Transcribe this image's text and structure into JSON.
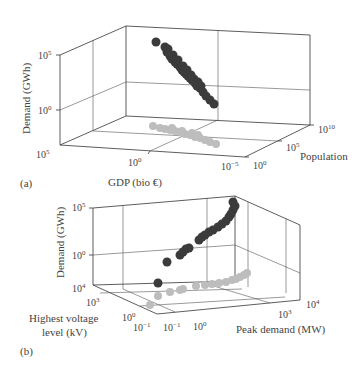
{
  "figure": {
    "panels": [
      {
        "id": "a",
        "label": "(a)",
        "zlabel": "Demand (GWh)",
        "xlabel": "GDP (bio €)",
        "ylabel": "Population",
        "z_ticks": [
          {
            "base": "10",
            "exp": "5"
          },
          {
            "base": "10",
            "exp": "0"
          }
        ],
        "x_ticks": [
          {
            "base": "10",
            "exp": "5"
          },
          {
            "base": "10",
            "exp": "0"
          },
          {
            "base": "10",
            "exp": "−5"
          }
        ],
        "y_ticks": [
          {
            "base": "10",
            "exp": "0"
          },
          {
            "base": "10",
            "exp": "5"
          },
          {
            "base": "10",
            "exp": "10"
          }
        ]
      },
      {
        "id": "b",
        "label": "(b)",
        "zlabel": "Demand (GWh)",
        "xlabel": "Peak demand (MW)",
        "ylabel_line1": "Highest voltage",
        "ylabel_line2": "level (kV)",
        "z_ticks": [
          {
            "base": "10",
            "exp": "5"
          },
          {
            "base": "10",
            "exp": "0"
          }
        ],
        "y_ticks": [
          {
            "base": "10",
            "exp": "4"
          },
          {
            "base": "10",
            "exp": "3"
          },
          {
            "base": "10",
            "exp": "0"
          },
          {
            "base": "10",
            "exp": "−1"
          }
        ],
        "x_ticks": [
          {
            "base": "10",
            "exp": "−1"
          },
          {
            "base": "10",
            "exp": "0"
          },
          {
            "base": "10",
            "exp": "3"
          },
          {
            "base": "10",
            "exp": "4"
          }
        ]
      }
    ]
  },
  "colors": {
    "points": "#3b3b3b",
    "projections": "#bdbdbd",
    "axes": "#333333"
  },
  "chart_data": [
    {
      "type": "scatter",
      "title": "",
      "panel": "(a)",
      "xlabel": "GDP (bio €)",
      "ylabel": "Population",
      "zlabel": "Demand (GWh)",
      "x_range_log10": [
        -5,
        5
      ],
      "y_range_log10": [
        0,
        10
      ],
      "z_range_log10": [
        -5,
        5
      ],
      "grid": true,
      "series": [
        {
          "name": "data (3D points)",
          "color": "#3b3b3b",
          "screen_points": [
            [
              156,
              42
            ],
            [
              165,
              47
            ],
            [
              167,
              52
            ],
            [
              170,
              56
            ],
            [
              172,
              59
            ],
            [
              175,
              62
            ],
            [
              177,
              64
            ],
            [
              180,
              67
            ],
            [
              182,
              70
            ],
            [
              184,
              72
            ],
            [
              186,
              74
            ],
            [
              188,
              76
            ],
            [
              190,
              78
            ],
            [
              192,
              80
            ],
            [
              195,
              83
            ],
            [
              197,
              86
            ],
            [
              200,
              88
            ],
            [
              203,
              92
            ],
            [
              206,
              96
            ],
            [
              210,
              100
            ],
            [
              214,
              104
            ],
            [
              168,
              49
            ],
            [
              173,
              55
            ],
            [
              178,
              60
            ],
            [
              183,
              66
            ],
            [
              187,
              70
            ],
            [
              191,
              75
            ],
            [
              194,
              79
            ],
            [
              198,
              82
            ],
            [
              201,
              86
            ]
          ]
        },
        {
          "name": "projection on floor",
          "color": "#bdbdbd",
          "screen_points": [
            [
              153,
              126
            ],
            [
              160,
              128
            ],
            [
              165,
              129
            ],
            [
              170,
              130
            ],
            [
              175,
              131
            ],
            [
              180,
              132
            ],
            [
              185,
              134
            ],
            [
              190,
              135
            ],
            [
              195,
              137
            ],
            [
              200,
              138
            ],
            [
              205,
              140
            ],
            [
              210,
              142
            ],
            [
              216,
              144
            ],
            [
              172,
              128
            ],
            [
              182,
              131
            ],
            [
              192,
              133
            ],
            [
              198,
              135
            ]
          ]
        }
      ],
      "note": "Log-log-log 3D scatter; Demand decreases along GDP axis direction shown, correlating with population"
    },
    {
      "type": "scatter",
      "title": "",
      "panel": "(b)",
      "xlabel": "Peak demand (MW)",
      "ylabel": "Highest voltage level (kV)",
      "zlabel": "Demand (GWh)",
      "x_range_log10": [
        -1,
        4
      ],
      "y_range_log10": [
        -1,
        4
      ],
      "z_range_log10": [
        -5,
        5
      ],
      "grid": true,
      "series": [
        {
          "name": "data (3D points)",
          "color": "#3b3b3b",
          "screen_points": [
            [
              158,
              283
            ],
            [
              167,
              262
            ],
            [
              180,
              255
            ],
            [
              183,
              252
            ],
            [
              186,
              249
            ],
            [
              189,
              248
            ],
            [
              199,
              240
            ],
            [
              202,
              237
            ],
            [
              205,
              235
            ],
            [
              209,
              232
            ],
            [
              213,
              230
            ],
            [
              218,
              227
            ],
            [
              222,
              224
            ],
            [
              226,
              221
            ],
            [
              229,
              217
            ],
            [
              231,
              214
            ],
            [
              233,
              210
            ],
            [
              235,
              206
            ],
            [
              233,
              202
            ]
          ]
        },
        {
          "name": "projection on floor",
          "color": "#bdbdbd",
          "screen_points": [
            [
              150,
              305
            ],
            [
              158,
              296
            ],
            [
              170,
              292
            ],
            [
              180,
              290
            ],
            [
              183,
              289
            ],
            [
              196,
              286
            ],
            [
              205,
              285
            ],
            [
              212,
              284
            ],
            [
              219,
              283
            ],
            [
              226,
              282
            ],
            [
              232,
              280
            ],
            [
              236,
              279
            ],
            [
              240,
              277
            ],
            [
              244,
              275
            ],
            [
              247,
              273
            ]
          ]
        }
      ],
      "note": "Log-log-log 3D scatter; Demand increases with Peak demand"
    }
  ]
}
